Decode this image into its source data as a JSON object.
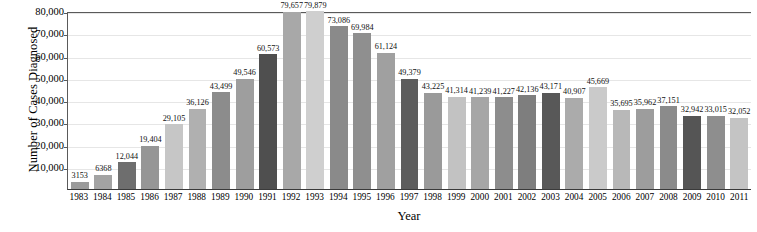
{
  "chart_data": {
    "type": "bar",
    "title": "",
    "xlabel": "Year",
    "ylabel": "Number of Cases Diagnosed",
    "ylim": [
      0,
      80000
    ],
    "grid": true,
    "legend": "none",
    "y_ticks": [
      {
        "value": 10000,
        "label": "10,000"
      },
      {
        "value": 20000,
        "label": "20,000"
      },
      {
        "value": 30000,
        "label": "30,000"
      },
      {
        "value": 40000,
        "label": "40,000"
      },
      {
        "value": 50000,
        "label": "50,000"
      },
      {
        "value": 60000,
        "label": "60,000"
      },
      {
        "value": 70000,
        "label": "70,000"
      },
      {
        "value": 80000,
        "label": "80,000"
      }
    ],
    "categories": [
      "1983",
      "1984",
      "1985",
      "1986",
      "1987",
      "1988",
      "1989",
      "1990",
      "1991",
      "1992",
      "1993",
      "1994",
      "1995",
      "1996",
      "1997",
      "1998",
      "1999",
      "2000",
      "2001",
      "2002",
      "2003",
      "2004",
      "2005",
      "2006",
      "2007",
      "2008",
      "2009",
      "2010",
      "2011"
    ],
    "values": [
      3153,
      6368,
      12044,
      19404,
      29105,
      36126,
      43499,
      49546,
      60573,
      79657,
      79879,
      73086,
      69984,
      61124,
      49379,
      43225,
      41314,
      41239,
      41227,
      42136,
      43171,
      40907,
      45669,
      35695,
      35962,
      37151,
      32942,
      33015,
      32052
    ],
    "data_labels": [
      "3153",
      "6368",
      "12,044",
      "19,404",
      "29,105",
      "36,126",
      "43,499",
      "49,546",
      "60,573",
      "79,657",
      "79,879",
      "73,086",
      "69,984",
      "61,124",
      "49,379",
      "43,225",
      "41,314",
      "41,239",
      "41,227",
      "42,136",
      "43,171",
      "40,907",
      "45,669",
      "35,695",
      "35,962",
      "37,151",
      "32,942",
      "33,015",
      "32,052"
    ],
    "bar_colors": [
      "#9b9b9b",
      "#a3a3a3",
      "#6e6e6e",
      "#969696",
      "#c6c6c6",
      "#b0b0b0",
      "#8c8c8c",
      "#9e9e9e",
      "#4f4f4f",
      "#a8a8a8",
      "#cfcfcf",
      "#8a8a8a",
      "#8f8f8f",
      "#a0a0a0",
      "#5d5d5d",
      "#9a9a9a",
      "#c2c2c2",
      "#a6a6a6",
      "#8d8d8d",
      "#7e7e7e",
      "#585858",
      "#ababab",
      "#cacaca",
      "#b8b8b8",
      "#9d9d9d",
      "#8b8b8b",
      "#555555",
      "#8e8e8e",
      "#c4c4c4"
    ],
    "axis_color": "#5a5a5a",
    "gridline_color": "#e6e6e6",
    "background_color": "#ffffff"
  }
}
